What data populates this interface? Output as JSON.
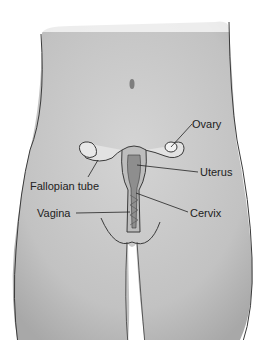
{
  "diagram": {
    "labels": {
      "ovary": "Ovary",
      "uterus": "Uterus",
      "fallopian_tube": "Fallopian tube",
      "vagina": "Vagina",
      "cervix": "Cervix"
    },
    "colors": {
      "skin": "#c4c4c4",
      "outline": "#3a3a3a",
      "background": "#ffffff"
    }
  }
}
